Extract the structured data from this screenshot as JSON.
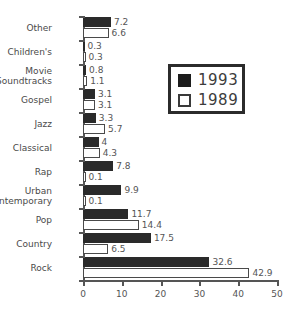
{
  "chart_data": {
    "type": "bar",
    "orientation": "horizontal",
    "title": "",
    "xlabel": "",
    "ylabel": "",
    "xlim": [
      0,
      50
    ],
    "xticks": [
      0,
      10,
      20,
      30,
      40,
      50
    ],
    "xtick_labels": [
      "0",
      "10",
      "20",
      "30",
      "40",
      "50"
    ],
    "grid": false,
    "legend_position": "upper-right-inset",
    "categories": [
      "Other",
      "Children's",
      "Movie\nSoundtracks",
      "Gospel",
      "Jazz",
      "Classical",
      "Rap",
      "Urban\nContemporary",
      "Pop",
      "Country",
      "Rock"
    ],
    "series": [
      {
        "name": "1993",
        "color": "#2a2a2a",
        "values": [
          7.2,
          0.3,
          0.8,
          3.1,
          3.3,
          4,
          7.8,
          9.9,
          11.7,
          17.5,
          32.6
        ],
        "value_labels": [
          "7.2",
          "0.3",
          "0.8",
          "3.1",
          "3.3",
          "4",
          "7.8",
          "9.9",
          "11.7",
          "17.5",
          "32.6"
        ]
      },
      {
        "name": "1989",
        "color": "#ffffff",
        "values": [
          6.6,
          0.3,
          1.1,
          3.1,
          5.7,
          4.3,
          0.1,
          0.1,
          14.4,
          6.5,
          42.9
        ],
        "value_labels": [
          "6.6",
          "0.3",
          "1.1",
          "3.1",
          "5.7",
          "4.3",
          "0.1",
          "0.1",
          "14.4",
          "6.5",
          "42.9"
        ]
      }
    ]
  },
  "legend": {
    "entries": [
      {
        "label": "1993",
        "swatch": "filled-square"
      },
      {
        "label": "1989",
        "swatch": "hollow-square"
      }
    ]
  },
  "footer": {
    "note": ""
  }
}
